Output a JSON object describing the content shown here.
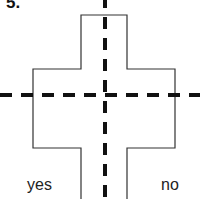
{
  "question": {
    "number": "5."
  },
  "figure": {
    "shape": "cross",
    "symmetry_lines": [
      "vertical",
      "horizontal"
    ],
    "line_style": "dashed",
    "colors": {
      "outline": "#333333",
      "dash": "#111111"
    }
  },
  "options": [
    {
      "label": "yes"
    },
    {
      "label": "no"
    }
  ]
}
